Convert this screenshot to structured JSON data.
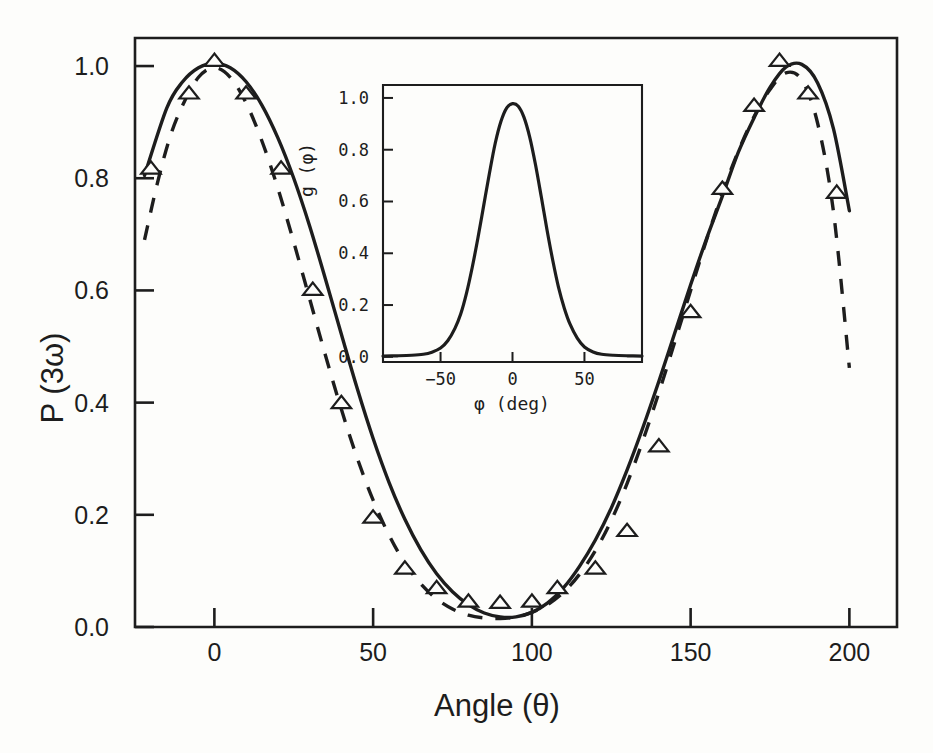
{
  "figure": {
    "background_color": "#fdfdfb",
    "ink_color": "#1d1d1d"
  },
  "chart_data": {
    "type": "line",
    "title": "",
    "xlabel": "Angle (θ)",
    "ylabel": "P (3ω)",
    "xlim": [
      -25,
      215
    ],
    "ylim": [
      0.0,
      1.05
    ],
    "grid": false,
    "legend": "none",
    "xticks": [
      0,
      50,
      100,
      150,
      200
    ],
    "xtick_labels": [
      "0",
      "50",
      "100",
      "150",
      "200"
    ],
    "yticks": [
      0.0,
      0.2,
      0.4,
      0.6,
      0.8,
      1.0
    ],
    "ytick_labels": [
      "0.0",
      "0.2",
      "0.4",
      "0.6",
      "0.8",
      "1.0"
    ],
    "series": [
      {
        "name": "theory-solid",
        "style": "solid",
        "x": [
          -22,
          -15,
          -10,
          -5,
          0,
          5,
          10,
          15,
          20,
          25,
          30,
          35,
          40,
          45,
          50,
          55,
          60,
          65,
          70,
          75,
          80,
          85,
          90,
          95,
          100,
          105,
          110,
          115,
          120,
          125,
          130,
          135,
          140,
          145,
          150,
          155,
          160,
          165,
          170,
          175,
          180,
          185,
          190,
          195,
          200
        ],
        "y": [
          0.805,
          0.925,
          0.972,
          0.997,
          1.005,
          0.997,
          0.972,
          0.93,
          0.872,
          0.8,
          0.715,
          0.62,
          0.522,
          0.425,
          0.336,
          0.258,
          0.192,
          0.138,
          0.095,
          0.063,
          0.04,
          0.025,
          0.018,
          0.018,
          0.026,
          0.043,
          0.07,
          0.108,
          0.155,
          0.212,
          0.28,
          0.356,
          0.438,
          0.524,
          0.61,
          0.692,
          0.768,
          0.846,
          0.908,
          0.962,
          0.998,
          1.003,
          0.97,
          0.888,
          0.742
        ]
      },
      {
        "name": "theory-dashed",
        "style": "dashed",
        "x": [
          -22,
          -18,
          -14,
          -10,
          -5,
          0,
          5,
          10,
          15,
          20,
          25,
          30,
          35,
          40,
          45,
          50,
          55,
          60,
          65,
          70,
          75,
          80,
          85,
          90,
          95,
          100,
          105,
          110,
          115,
          120,
          125,
          130,
          135,
          140,
          145,
          150,
          155,
          160,
          165,
          170,
          175,
          180,
          185,
          190,
          195,
          200
        ],
        "y": [
          0.69,
          0.79,
          0.873,
          0.93,
          0.98,
          0.997,
          0.98,
          0.934,
          0.866,
          0.782,
          0.686,
          0.585,
          0.484,
          0.388,
          0.301,
          0.226,
          0.164,
          0.114,
          0.077,
          0.05,
          0.032,
          0.021,
          0.016,
          0.015,
          0.018,
          0.026,
          0.04,
          0.062,
          0.094,
          0.136,
          0.19,
          0.256,
          0.333,
          0.418,
          0.508,
          0.6,
          0.69,
          0.774,
          0.848,
          0.91,
          0.958,
          0.988,
          0.975,
          0.898,
          0.74,
          0.462
        ]
      },
      {
        "name": "experimental-data",
        "style": "markers",
        "marker": "triangle-up",
        "x": [
          -20,
          -8,
          0,
          10,
          21,
          31,
          40,
          50,
          60,
          70,
          80,
          90,
          100,
          108,
          120,
          130,
          140,
          150,
          160,
          170,
          178,
          187,
          196
        ],
        "y": [
          0.818,
          0.952,
          1.01,
          0.952,
          0.818,
          0.602,
          0.4,
          0.196,
          0.105,
          0.07,
          0.046,
          0.044,
          0.046,
          0.07,
          0.105,
          0.172,
          0.323,
          0.562,
          0.782,
          0.93,
          1.01,
          0.952,
          0.775
        ]
      }
    ],
    "inset": {
      "type": "line",
      "xlabel": "φ  (deg)",
      "ylabel": "g (φ)",
      "xlim": [
        -90,
        90
      ],
      "ylim": [
        -0.02,
        1.05
      ],
      "grid": false,
      "xticks": [
        -50,
        0,
        50
      ],
      "xtick_labels": [
        "−50",
        "0",
        "50"
      ],
      "yticks": [
        0.0,
        0.2,
        0.4,
        0.6,
        0.8,
        1.0
      ],
      "ytick_labels": [
        "0.0",
        "0.2",
        "0.4",
        "0.6",
        "0.8",
        "1.0"
      ],
      "series": [
        {
          "name": "orientation-distribution",
          "style": "solid",
          "x": [
            -90,
            -80,
            -70,
            -62,
            -56,
            -50,
            -45,
            -40,
            -36,
            -32,
            -28,
            -24,
            -20,
            -16,
            -12,
            -8,
            -4,
            0,
            4,
            8,
            12,
            16,
            20,
            24,
            28,
            32,
            36,
            40,
            45,
            50,
            56,
            62,
            70,
            80,
            90
          ],
          "y": [
            0.003,
            0.004,
            0.006,
            0.01,
            0.018,
            0.034,
            0.062,
            0.11,
            0.165,
            0.245,
            0.345,
            0.46,
            0.585,
            0.71,
            0.825,
            0.91,
            0.962,
            0.978,
            0.968,
            0.925,
            0.848,
            0.742,
            0.618,
            0.49,
            0.372,
            0.268,
            0.188,
            0.126,
            0.072,
            0.038,
            0.019,
            0.01,
            0.006,
            0.004,
            0.003
          ]
        }
      ]
    }
  }
}
